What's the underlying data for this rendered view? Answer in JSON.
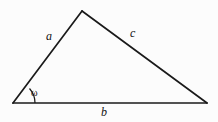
{
  "figure": {
    "type": "geometry-diagram",
    "shape": "triangle",
    "background_color": "#fcfcfc",
    "stroke_color": "#1a1a1a",
    "text_color": "#111111",
    "width": 218,
    "height": 122
  },
  "labels": {
    "side_a": "a",
    "side_b": "b",
    "side_c": "c",
    "angle_omega": "ω"
  },
  "geometry": {
    "vertices": {
      "left": {
        "x": 13,
        "y": 103
      },
      "apex": {
        "x": 82,
        "y": 11
      },
      "right": {
        "x": 207,
        "y": 103
      }
    },
    "sides": [
      {
        "name": "a",
        "from": "left",
        "to": "apex"
      },
      {
        "name": "c",
        "from": "apex",
        "to": "right"
      },
      {
        "name": "b",
        "from": "left",
        "to": "right"
      }
    ],
    "angle_arc": {
      "at": "left",
      "radius": 22,
      "start": {
        "x": 35,
        "y": 103
      },
      "end": {
        "x": 29,
        "y": 82
      }
    },
    "stroke_width": 1.6
  }
}
